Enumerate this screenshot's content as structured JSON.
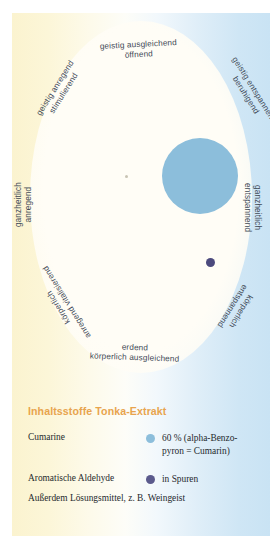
{
  "wheel": {
    "labels": [
      {
        "id": "top",
        "line1": "geistig ausgleichend",
        "line2": "öffnend"
      },
      {
        "id": "ul",
        "line1": "geistig anregend",
        "line2": "stimulierend"
      },
      {
        "id": "ur",
        "line1": "geistig entspannend",
        "line2": "beruhigend"
      },
      {
        "id": "ml",
        "line1": "ganzheitlich",
        "line2": "anregend"
      },
      {
        "id": "mr",
        "line1": "ganzheitlich",
        "line2": "entspannend"
      },
      {
        "id": "ll",
        "line1": "körperlich",
        "line2": "anregend vitalisierend"
      },
      {
        "id": "lr",
        "line1": "körperlich",
        "line2": "entspannend"
      },
      {
        "id": "bot",
        "line1": "erdend",
        "line2": "körperlich ausgleichend"
      }
    ]
  },
  "chart_data": {
    "type": "scatter",
    "title": "Inhaltsstoffe Tonka-Extrakt",
    "xlabel": "anregend ↔ entspannend",
    "ylabel": "geistig ↔ körperlich",
    "axis_labels": [
      "geistig ausgleichend öffnend",
      "geistig anregend stimulierend",
      "geistig entspannend beruhigend",
      "ganzheitlich anregend",
      "ganzheitlich entspannend",
      "körperlich anregend vitalisierend",
      "körperlich entspannend",
      "erdend körperlich ausgleichend"
    ],
    "grid": false,
    "legend_position": "bottom",
    "points": [
      {
        "name": "Cumarine",
        "value": 60,
        "unit": "%",
        "detail": "alpha-Benzopyron = Cumarin",
        "color": "#8cbedb",
        "size": 76,
        "x": 0.66,
        "y": 0.44
      },
      {
        "name": "Aromatische Aldehyde",
        "value": null,
        "unit": "",
        "detail": "in Spuren",
        "color": "#4c4a7d",
        "size": 9,
        "x": 0.77,
        "y": 0.71
      }
    ]
  },
  "legend": {
    "title": "Inhaltsstoffe Tonka-Extrakt",
    "rows": [
      {
        "name": "Cumarine",
        "dot_color": "#8cbedb",
        "value_line1": "60 % (alpha-Benzo-",
        "value_line2": "pyron = Cumarin)"
      },
      {
        "name": "Aromatische Aldehyde",
        "dot_color": "#5b5a8c",
        "value_line1": "in Spuren",
        "value_line2": ""
      }
    ],
    "note": "Außerdem Lösungsmittel, z. B. Weingeist"
  },
  "colors": {
    "accent_title": "#e8a44e",
    "gradient_left": "#fbf3cf",
    "gradient_right": "#c9e3f4",
    "cumarine": "#8cbedb",
    "aldehyde": "#4c4a7d",
    "label_text": "#3f4a57"
  }
}
